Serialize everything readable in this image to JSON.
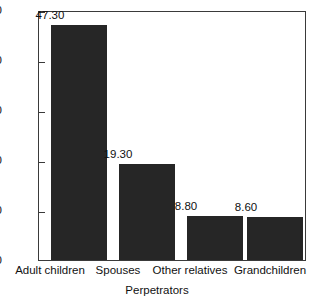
{
  "chart_data": {
    "type": "bar",
    "title": "",
    "xlabel": "Perpetrators",
    "ylabel": "Percent (%)",
    "categories": [
      "Adult children",
      "Spouses",
      "Other relatives",
      "Grandchildren"
    ],
    "values": [
      47.3,
      19.3,
      8.8,
      8.6
    ],
    "value_labels": [
      "47.30",
      "19.30",
      "8.80",
      "8.60"
    ],
    "ylim": [
      0,
      50
    ],
    "yticks": [
      0,
      10,
      20,
      30,
      40,
      50
    ],
    "ytick_labels": [
      "0",
      "10",
      "20",
      "30",
      "40",
      "50"
    ],
    "grid": false,
    "legend": null,
    "bar_color": "#262626",
    "axis_color": "#3a3a3a",
    "text_color": "#111111"
  }
}
